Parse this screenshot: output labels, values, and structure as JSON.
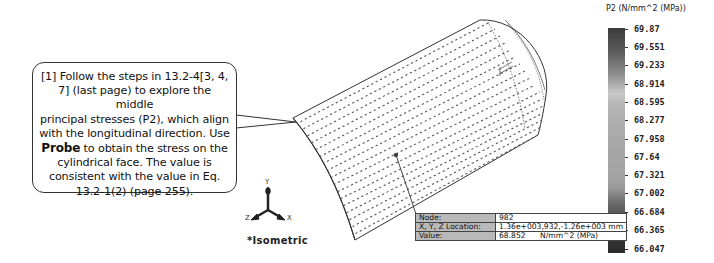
{
  "callout": {
    "line1": "[1] Follow the steps in 13.2-4[3, 4,",
    "line2": "7] (last page) to explore the middle",
    "line3": "principal stresses (P2), which align",
    "line4": "with the longitudinal direction.  Use",
    "line5_bold": "Probe",
    "line5_rest": " to obtain the stress on the",
    "line6": "cylindrical face. The value is",
    "line7": "consistent with the value in Eq.",
    "line8": "13.2-1(2) (page 255)."
  },
  "legend": {
    "title": "P2 (N/mm^2 (MPa))",
    "ticks": [
      "69.87",
      "69.551",
      "69.233",
      "68.914",
      "68.595",
      "68.277",
      "67.958",
      "67.64",
      "67.321",
      "67.002",
      "66.684",
      "66.365",
      "66.047"
    ],
    "max": 69.87,
    "min": 66.047
  },
  "probe": {
    "rows": [
      {
        "label": "Node:",
        "value": "982"
      },
      {
        "label": "X, Y, Z Location:",
        "value": "1.36e+003,932,-1.26e+003 mm"
      },
      {
        "label": "Value:",
        "value": "68.852      N/mm^2 (MPa)"
      }
    ]
  },
  "triad": {
    "axes": {
      "x": "X",
      "y": "Y",
      "z": "Z"
    },
    "view_label": "*Isometric"
  },
  "colors": {
    "background": "#ffffff",
    "outline": "#333333",
    "probe_label_bg": "#b9b9b9"
  }
}
